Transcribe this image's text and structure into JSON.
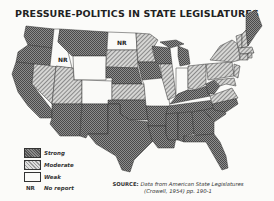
{
  "title": "PRESSURE-POLITICS IN STATE LEGISLATURES",
  "legend": {
    "items": [
      {
        "key": "strong",
        "label": "Strong"
      },
      {
        "key": "moderate",
        "label": "Moderate"
      },
      {
        "key": "weak",
        "label": "Weak"
      }
    ],
    "nr_abbr": "NR",
    "nr_label": "No report"
  },
  "map_labels": {
    "idaho_nr": "NR",
    "north_dakota_nr": "NR"
  },
  "source": {
    "prefix": "SOURCE:",
    "line1": "Data from American State Legislatures",
    "line2": "(Crowell, 1954) pp. 190-1"
  },
  "states": {
    "strong": [
      "WA",
      "OR",
      "CA",
      "AZ",
      "NM",
      "MT",
      "NE",
      "TX",
      "OK",
      "KS",
      "AR",
      "LA",
      "MS",
      "AL",
      "GA",
      "FL",
      "SC",
      "NC",
      "TN",
      "KY",
      "WI",
      "MI",
      "IA",
      "ME",
      "WV",
      "MN"
    ],
    "moderate": [
      "NV",
      "UT",
      "CO",
      "SD",
      "IL",
      "OH",
      "PA",
      "NY",
      "VA",
      "VT",
      "NH",
      "MA",
      "CT",
      "RI",
      "NJ",
      "MD",
      "DE"
    ],
    "weak": [
      "ID",
      "WY",
      "MO",
      "IN",
      "ND"
    ],
    "no_report": [
      "ID",
      "ND"
    ]
  }
}
